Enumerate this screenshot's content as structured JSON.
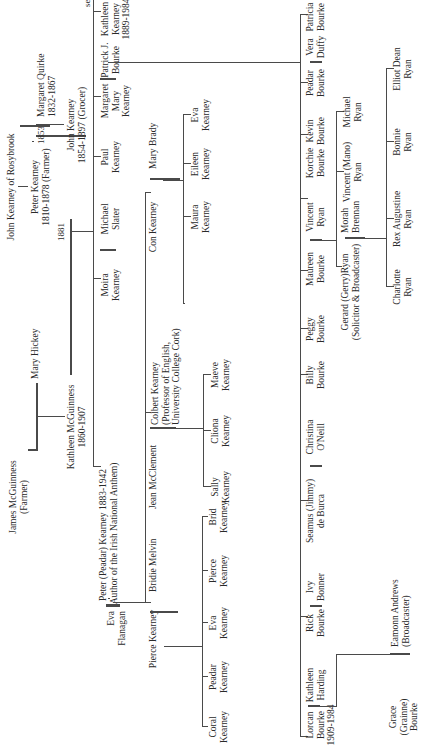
{
  "tree": {
    "gen1": {
      "ancestor": "John Kearney of Rosybrook",
      "peter": {
        "name": "Peter Kearney",
        "dates": "1810-1878 (Farmer)"
      },
      "margaret_quirke": {
        "name": "Margaret Quirke",
        "dates": "1832-1867"
      },
      "marriage_year": "1853"
    },
    "gen2": {
      "james": {
        "name": "James McGuinness",
        "note": "(Farmer)"
      },
      "mary_hickey": "Mary Hickey",
      "kathleen": {
        "name": "Kathleen McGuinness",
        "dates": "1860-1907"
      },
      "john": {
        "name": "John Kearney",
        "dates": "1854-1897 (Grocer)"
      },
      "marriage_year": "1881"
    },
    "gen3": {
      "peadar": {
        "name": "Peter (Peadar) Kearney 1883-1942",
        "note": "(Author of the Irish National Anthem)"
      },
      "eva_flanagan": {
        "l1": "Eva",
        "l2": "Flanagan"
      },
      "moira": {
        "l1": "Moira",
        "l2": "Kearney"
      },
      "michael_slater": {
        "l1": "Michael",
        "l2": "Slater"
      },
      "paul": {
        "l1": "Paul",
        "l2": "Kearney"
      },
      "margaret_mary": {
        "l1": "Margaret",
        "l2": "Mary",
        "l3": "Kearney"
      },
      "patrick_bourke": {
        "l1": "Patrick J.",
        "l2": "Bourke"
      },
      "kathleen_k": {
        "l1": "Kathleen",
        "l2": "Kearney",
        "l3": "1889-1984"
      },
      "see_table": "see Table 2"
    },
    "peadar_children": {
      "pierce": "Pierce Kearney",
      "bridie": "Bridie Melvin",
      "con": "Con Kearney",
      "mary_brady": "Mary Brady",
      "colbert": {
        "l1": "Colbert Kearney",
        "l2": "(Professor of English,",
        "l3": "University College Cork)"
      },
      "jean": "Jean McClement"
    },
    "pierce_children": [
      {
        "l1": "Coral",
        "l2": "Kearney"
      },
      {
        "l1": "Peadar",
        "l2": "Kearney"
      },
      {
        "l1": "Eva",
        "l2": "Kearney"
      },
      {
        "l1": "Pierce",
        "l2": "Kearney"
      },
      {
        "l1": "Brid",
        "l2": "Kearney"
      }
    ],
    "colbert_children": [
      {
        "l1": "Sally",
        "l2": "Kearney"
      },
      {
        "l1": "Cliona",
        "l2": "Kearney"
      },
      {
        "l1": "Maeve",
        "l2": "Kearney"
      }
    ],
    "con_children": [
      {
        "l1": "Maura",
        "l2": "Kearney"
      },
      {
        "l1": "Eileen",
        "l2": "Kearney"
      },
      {
        "l1": "Eva",
        "l2": "Kearney"
      }
    ],
    "bourke_children": [
      {
        "l1": "Lorcan",
        "l2": "Bourke",
        "l3": "1909-1984"
      },
      {
        "l1": "Kathleen",
        "l2": "Harding"
      },
      {
        "l1": "Rick",
        "l2": "Bourke"
      },
      {
        "l1": "Ivy",
        "l2": "Bonner"
      },
      {
        "l1": "Seamus (Jimmy)",
        "l2": "de Burca"
      },
      {
        "l1": "Christina",
        "l2": "O'Neill"
      },
      {
        "l1": "Billy",
        "l2": "Bourke"
      },
      {
        "l1": "Peggy",
        "l2": "Bourke"
      },
      {
        "l1": "Maureen",
        "l2": "Bourke"
      },
      {
        "l1": "Vincent",
        "l2": "Ryan"
      },
      {
        "l1": "Korchie",
        "l2": "Bourke"
      },
      {
        "l1": "Kevin",
        "l2": "Bourke"
      },
      {
        "l1": "Peadar",
        "l2": "Bourke"
      },
      {
        "l1": "Vera",
        "l2": "Duffy"
      },
      {
        "l1": "Patricia",
        "l2": "Bourke"
      }
    ],
    "lorcan_child": {
      "grace": {
        "l1": "Grace",
        "l2": "(Grainne)",
        "l3": "Bourke"
      },
      "eamonn": {
        "l1": "Eamonn Andrews",
        "l2": "(Broadcaster)"
      }
    },
    "maureen_children": {
      "gerard": {
        "l1": "Gerard (Gerry)Ryan",
        "l2": "(Solicitor & Broadcaster)"
      },
      "morah": {
        "l1": "Morah",
        "l2": "Brennan"
      },
      "vincent_mano": {
        "l1": "Vincent (Mano)",
        "l2": "Ryan"
      },
      "michael": {
        "l1": "Michael",
        "l2": "Ryan"
      }
    },
    "gerard_children": [
      {
        "l1": "Charlotte",
        "l2": "Ryan"
      },
      {
        "l1": "Rex Augustine",
        "l2": "Ryan"
      },
      {
        "l1": "Bonnie",
        "l2": "Ryan"
      },
      {
        "l1": "Elliot Dean",
        "l2": "Ryan"
      }
    ]
  }
}
